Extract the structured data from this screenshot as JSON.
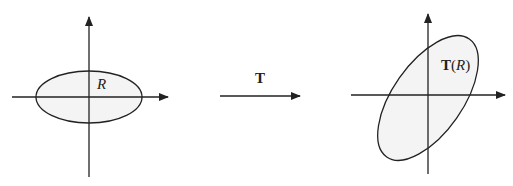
{
  "diagram": {
    "left_panel": {
      "region_label": "R",
      "shape": "ellipse",
      "center": [
        89,
        97
      ],
      "rx": 53,
      "ry": 26,
      "fill": "#f4f4f4"
    },
    "transform": {
      "label": "T"
    },
    "right_panel": {
      "region_label_bold": "T",
      "region_label_open": "(",
      "region_label_italic": "R",
      "region_label_close": ")",
      "shape": "ellipse",
      "center": [
        428,
        98
      ],
      "rx": 72,
      "ry": 35,
      "rotation_deg": -55,
      "fill": "#f4f4f4"
    },
    "colors": {
      "stroke": "#222222",
      "background": "#ffffff"
    }
  }
}
